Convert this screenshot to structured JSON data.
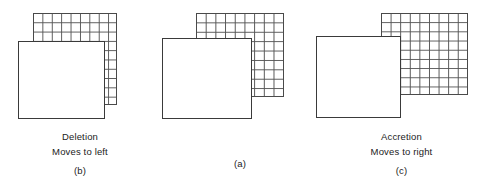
{
  "figure": {
    "colors": {
      "background": "#ffffff",
      "grid_line": "#555555",
      "square_outline": "#3a3a3a",
      "text": "#222222"
    }
  },
  "panels": [
    {
      "id": "b",
      "order": 1,
      "caption_line_1": "Deletion",
      "caption_line_2": "Moves to left",
      "caption_label": "(b)",
      "grid": {
        "columns": 9,
        "rows": 10
      },
      "square": {
        "overlap": "grid offset right and up from square"
      }
    },
    {
      "id": "a",
      "order": 2,
      "caption_line_1": "",
      "caption_line_2": "",
      "caption_label": "(a)",
      "grid": {
        "columns": 9,
        "rows": 9
      },
      "square": {
        "overlap": "grid offset right and up from square"
      }
    },
    {
      "id": "c",
      "order": 3,
      "caption_line_1": "Accretion",
      "caption_line_2": "Moves to right",
      "caption_label": "(c)",
      "grid": {
        "columns": 9,
        "rows": 9
      },
      "square": {
        "overlap": "grid offset right and up from square"
      }
    }
  ]
}
